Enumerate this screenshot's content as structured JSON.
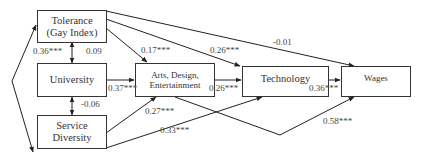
{
  "nodes": {
    "tolerance": {
      "line1": "Tolerance",
      "line2": "(Gay Index)"
    },
    "university": {
      "label": "University"
    },
    "service": {
      "line1": "Service",
      "line2": "Diversity"
    },
    "arts": {
      "line1": "Arts, Design,",
      "line2": "Entertainment"
    },
    "technology": {
      "label": "Technology"
    },
    "wages": {
      "label": "Wages"
    }
  },
  "coefficients": {
    "tolerance_service": "0.36***",
    "tolerance_university": "0.09",
    "university_service": "-0.06",
    "tolerance_arts": "0.17***",
    "tolerance_technology": "0.26***",
    "tolerance_wages": "-0.01",
    "university_arts": "0.37***",
    "arts_technology": "0.26***",
    "technology_wages": "0.36***",
    "service_arts": "0.27***",
    "service_technology": "0.33***",
    "arts_wages": "0.58***"
  },
  "colors": {
    "line": "#222222",
    "box_border": "#333333"
  }
}
